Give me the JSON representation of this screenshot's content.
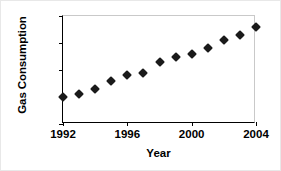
{
  "chart_data": {
    "type": "scatter",
    "title": "",
    "xlabel": "Year",
    "ylabel": "Gas Consumption",
    "x": [
      1992,
      1993,
      1994,
      1995,
      1996,
      1997,
      1998,
      1999,
      2000,
      2001,
      2002,
      2003,
      2004
    ],
    "values": [
      110,
      111,
      113,
      116,
      118,
      119,
      123,
      125,
      126,
      128,
      131,
      133,
      136
    ],
    "xlim": [
      1992,
      2004
    ],
    "ylim": [
      100,
      140
    ],
    "xticks": [
      1992,
      1996,
      2000,
      2004
    ],
    "yticks": [
      100,
      110,
      120,
      130,
      140
    ],
    "xtick_labels": [
      "1992",
      "1996",
      "2000",
      "2004"
    ],
    "ytick_labels": [
      "100",
      "110",
      "120",
      "130",
      "140"
    ],
    "grid": false,
    "legend": null,
    "marker": "diamond",
    "marker_color": "#1a1a1a",
    "series": [
      {
        "name": "Gas Consumption",
        "values": [
          110,
          111,
          113,
          116,
          118,
          119,
          123,
          125,
          126,
          128,
          131,
          133,
          136
        ]
      }
    ]
  }
}
